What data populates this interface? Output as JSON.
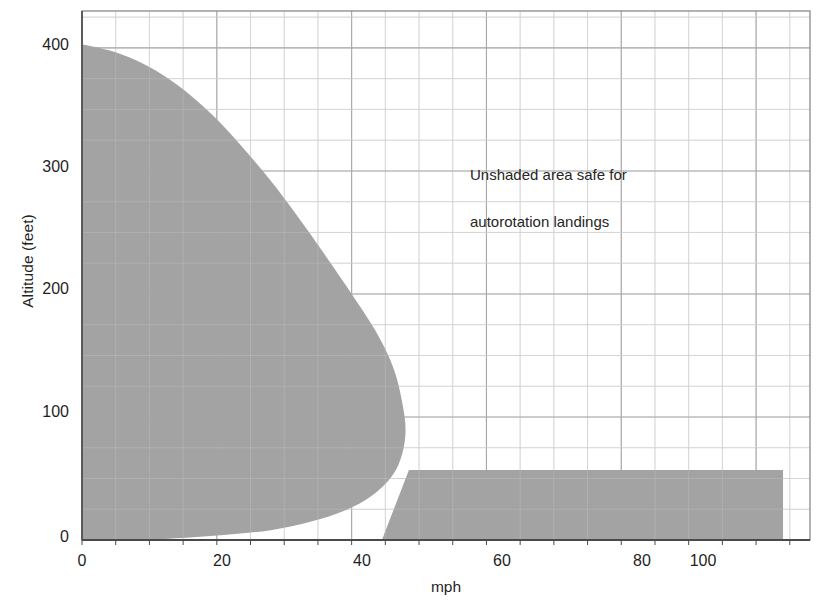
{
  "chart_data": {
    "type": "area",
    "title": "",
    "xlabel": "mph",
    "ylabel": "Altitude (feet)",
    "xlim": [
      0,
      108
    ],
    "ylim": [
      0,
      430
    ],
    "xticks": [
      0,
      20,
      40,
      60,
      80,
      100
    ],
    "yticks": [
      0,
      100,
      200,
      300,
      400
    ],
    "xtick_labels": [
      "0",
      "20",
      "40",
      "60",
      "80",
      "100"
    ],
    "ytick_labels": [
      "0",
      "100",
      "200",
      "300",
      "400"
    ],
    "x_minor_step": 5,
    "y_minor_step": 25,
    "grid": true,
    "legend": "none",
    "annotations": [
      {
        "text": "Unshaded area safe for\nautorotation landings",
        "x": 56,
        "y": 330
      }
    ],
    "series": [
      {
        "name": "Low-speed avoid region",
        "kind": "filled-region",
        "fill_color": "#a3a3a3",
        "points": [
          [
            0,
            403
          ],
          [
            4,
            398
          ],
          [
            8,
            390
          ],
          [
            12,
            378
          ],
          [
            16,
            362
          ],
          [
            20,
            342
          ],
          [
            24,
            318
          ],
          [
            28,
            292
          ],
          [
            32,
            263
          ],
          [
            36,
            232
          ],
          [
            40,
            200
          ],
          [
            43,
            175
          ],
          [
            45,
            155
          ],
          [
            46.5,
            135
          ],
          [
            47.5,
            112
          ],
          [
            48,
            90
          ],
          [
            47.5,
            70
          ],
          [
            46,
            52
          ],
          [
            43,
            36
          ],
          [
            39,
            24
          ],
          [
            34,
            15
          ],
          [
            28,
            8
          ],
          [
            21,
            4
          ],
          [
            13,
            1
          ],
          [
            6,
            0
          ],
          [
            0,
            0
          ]
        ]
      },
      {
        "name": "High-speed low-altitude avoid region",
        "kind": "filled-region",
        "fill_color": "#a3a3a3",
        "points": [
          [
            44.5,
            0
          ],
          [
            104,
            0
          ],
          [
            104,
            57
          ],
          [
            48.5,
            57
          ]
        ]
      }
    ]
  },
  "axes": {
    "y_title": "Altitude (feet)",
    "x_title": "mph",
    "y_ticks": [
      {
        "value": 400,
        "label": "400"
      },
      {
        "value": 300,
        "label": "300"
      },
      {
        "value": 200,
        "label": "200"
      },
      {
        "value": 100,
        "label": "100"
      },
      {
        "value": 0,
        "label": "0"
      }
    ],
    "x_ticks": [
      {
        "value": 0,
        "label": "0"
      },
      {
        "value": 20,
        "label": "20"
      },
      {
        "value": 40,
        "label": "40"
      },
      {
        "value": 60,
        "label": "60"
      },
      {
        "value": 80,
        "label": "80"
      },
      {
        "value": 100,
        "label": "100"
      }
    ]
  },
  "annotation": {
    "line1": "Unshaded area safe for",
    "line2": "autorotation landings"
  },
  "colors": {
    "shaded_region": "#a3a3a3",
    "grid_minor": "#d3d3d3",
    "grid_major": "#a8a8a8",
    "axis_line": "#4a4a4a",
    "plot_border": "#8a8a8a",
    "background": "#ffffff",
    "text": "#1f1f1f"
  }
}
